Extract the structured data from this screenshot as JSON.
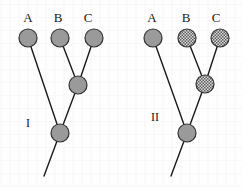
{
  "figure": {
    "width": 243,
    "height": 187,
    "background_color": "#fefefe"
  },
  "style": {
    "node_fill_solid": "#9a9a9a",
    "node_fill_hatched": "#8f8f8f",
    "node_stroke": "#333333",
    "branch_stroke": "#1a1a1a",
    "node_radius": 9,
    "branch_width": 1.4,
    "node_stroke_width": 1.2
  },
  "panels": [
    {
      "id": "I",
      "label": "I",
      "label_x": 28,
      "label_y": 127,
      "taxa": [
        {
          "name": "A",
          "label_x": 28,
          "label_y": 22,
          "node_x": 28,
          "node_y": 38,
          "fill": "solid"
        },
        {
          "name": "B",
          "label_x": 58,
          "label_y": 22,
          "node_x": 60,
          "node_y": 38,
          "fill": "solid"
        },
        {
          "name": "C",
          "label_x": 88,
          "label_y": 22,
          "node_x": 94,
          "node_y": 38,
          "fill": "solid"
        }
      ],
      "internal_nodes": [
        {
          "id": "BC",
          "x": 78,
          "y": 85,
          "fill": "solid"
        },
        {
          "id": "root",
          "x": 60,
          "y": 133,
          "fill": "solid"
        }
      ],
      "branches": [
        {
          "from": "A",
          "x1": 28,
          "y1": 38,
          "x2": 60,
          "y2": 133
        },
        {
          "from": "B",
          "x1": 60,
          "y1": 38,
          "x2": 78,
          "y2": 85
        },
        {
          "from": "C",
          "x1": 94,
          "y1": 38,
          "x2": 78,
          "y2": 85
        },
        {
          "from": "BC",
          "x1": 78,
          "y1": 85,
          "x2": 60,
          "y2": 133
        },
        {
          "from": "root",
          "x1": 60,
          "y1": 133,
          "x2": 44,
          "y2": 176
        }
      ]
    },
    {
      "id": "II",
      "label": "II",
      "label_x": 155,
      "label_y": 121,
      "taxa": [
        {
          "name": "A",
          "label_x": 152,
          "label_y": 22,
          "node_x": 153,
          "node_y": 38,
          "fill": "solid"
        },
        {
          "name": "B",
          "label_x": 186,
          "label_y": 22,
          "node_x": 187,
          "node_y": 38,
          "fill": "hatched"
        },
        {
          "name": "C",
          "label_x": 216,
          "label_y": 22,
          "node_x": 220,
          "node_y": 38,
          "fill": "hatched"
        }
      ],
      "internal_nodes": [
        {
          "id": "BC",
          "x": 205,
          "y": 84,
          "fill": "hatched"
        },
        {
          "id": "root",
          "x": 187,
          "y": 133,
          "fill": "solid"
        }
      ],
      "branches": [
        {
          "from": "A",
          "x1": 153,
          "y1": 38,
          "x2": 187,
          "y2": 133
        },
        {
          "from": "B",
          "x1": 187,
          "y1": 38,
          "x2": 205,
          "y2": 84
        },
        {
          "from": "C",
          "x1": 220,
          "y1": 38,
          "x2": 205,
          "y2": 84
        },
        {
          "from": "BC",
          "x1": 205,
          "y1": 84,
          "x2": 187,
          "y2": 133
        },
        {
          "from": "root",
          "x1": 187,
          "y1": 133,
          "x2": 171,
          "y2": 176
        }
      ]
    }
  ]
}
